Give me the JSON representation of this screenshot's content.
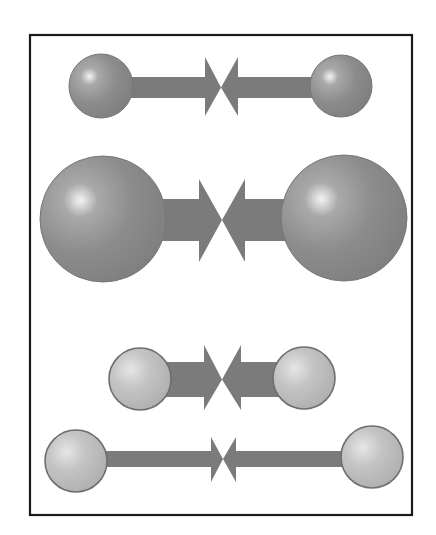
{
  "canvas": {
    "width": 436,
    "height": 535,
    "background": "#ffffff"
  },
  "frame": {
    "x": 30,
    "y": 35,
    "width": 382,
    "height": 480,
    "stroke": "#1a1a1a"
  },
  "colors": {
    "dark_sphere": "#8a8a8a",
    "dark_sphere_edge": "#767676",
    "light_sphere": "#bcbcbc",
    "light_sphere_edge": "#6e6e6e",
    "arrow": "#7b7b7b",
    "highlight": "#ffffff"
  },
  "rows": [
    {
      "name": "pair-1-small-dark",
      "sphere_style": "dark",
      "left_sphere": {
        "cx": 101,
        "cy": 86,
        "r": 32
      },
      "right_sphere": {
        "cx": 341,
        "cy": 86,
        "r": 31
      },
      "meet_x": 221,
      "shaft": {
        "y1": 77,
        "y2": 98
      },
      "head": {
        "y1": 57,
        "y2": 116,
        "left_base_x": 205,
        "right_base_x": 238
      }
    },
    {
      "name": "pair-2-large-dark",
      "sphere_style": "dark",
      "left_sphere": {
        "cx": 103,
        "cy": 219,
        "r": 63
      },
      "right_sphere": {
        "cx": 344,
        "cy": 218,
        "r": 63
      },
      "meet_x": 222,
      "shaft": {
        "y1": 199,
        "y2": 241
      },
      "head": {
        "y1": 179,
        "y2": 262,
        "left_base_x": 199,
        "right_base_x": 245
      }
    },
    {
      "name": "pair-3-close-light",
      "sphere_style": "light",
      "left_sphere": {
        "cx": 140,
        "cy": 379,
        "r": 31
      },
      "right_sphere": {
        "cx": 304,
        "cy": 378,
        "r": 31
      },
      "meet_x": 222,
      "shaft": {
        "y1": 362,
        "y2": 397
      },
      "head": {
        "y1": 345,
        "y2": 410,
        "left_base_x": 204,
        "right_base_x": 241
      }
    },
    {
      "name": "pair-4-far-light",
      "sphere_style": "light",
      "left_sphere": {
        "cx": 76,
        "cy": 461,
        "r": 31
      },
      "right_sphere": {
        "cx": 372,
        "cy": 457,
        "r": 31
      },
      "meet_x": 223,
      "shaft": {
        "y1": 451,
        "y2": 467
      },
      "head": {
        "y1": 437,
        "y2": 482,
        "left_base_x": 211,
        "right_base_x": 236
      }
    }
  ]
}
